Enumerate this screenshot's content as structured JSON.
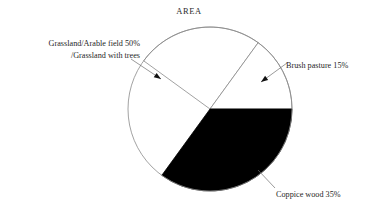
{
  "chart": {
    "title": "AREA"
  },
  "labels": {
    "grassland_line1": "Grassland/Arable field 50%",
    "grassland_line2": "/Grassland with trees",
    "brush": "Brush pasture 15%",
    "coppice": "Coppice wood 35%"
  },
  "chart_data": {
    "type": "pie",
    "title": "AREA",
    "xlabel": "",
    "ylabel": "",
    "legend_position": "callout-labels",
    "grid": false,
    "total": 100,
    "units": "percent",
    "center": {
      "x": 210,
      "y": 109
    },
    "radius": 82,
    "categories": [
      "Grassland/Arable field /Grassland with trees",
      "Brush pasture",
      "Coppice wood"
    ],
    "values": [
      50,
      15,
      35
    ],
    "slices": [
      {
        "name": "Grassland/Arable field /Grassland with trees",
        "label": "Grassland/Arable field 50% /Grassland with trees",
        "value": 50,
        "color": "#ffffff",
        "stroke": "#8a8a8a",
        "start_angle_deg": 216,
        "end_angle_deg": 306,
        "sweep_deg": 180
      },
      {
        "name": "Brush pasture",
        "label": "Brush pasture 15%",
        "value": 15,
        "color": "#ffffff",
        "stroke": "#8a8a8a",
        "start_angle_deg": 306,
        "end_angle_deg": 360,
        "sweep_deg": 54
      },
      {
        "name": "Coppice wood",
        "label": "Coppice wood 35%",
        "value": 35,
        "color": "#000000",
        "stroke": "#000000",
        "start_angle_deg": 0,
        "end_angle_deg": 126,
        "sweep_deg": 126
      }
    ],
    "annotations": [
      {
        "name": "grassland-leader",
        "text": "Grassland/Arable field 50% /Grassland with trees",
        "from": {
          "x": 131,
          "y": 59
        },
        "to": {
          "x": 161,
          "y": 79
        }
      },
      {
        "name": "brush-leader",
        "text": "Brush pasture 15%",
        "from": {
          "x": 287,
          "y": 63
        },
        "to": {
          "x": 261,
          "y": 82
        }
      },
      {
        "name": "coppice-leader",
        "text": "Coppice wood 35%",
        "from": {
          "x": 275,
          "y": 188
        },
        "to": {
          "x": 258,
          "y": 170
        }
      }
    ]
  },
  "colors": {
    "background": "#ffffff",
    "slice_dark": "#000000",
    "slice_light": "#ffffff",
    "outline": "#8a8a8a",
    "text": "#1f1f1f"
  }
}
